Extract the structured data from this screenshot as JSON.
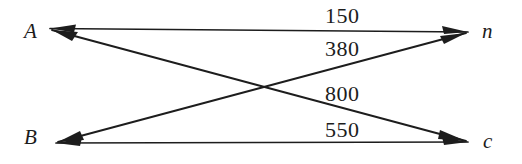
{
  "diagram": {
    "type": "bipartite-flow-network",
    "background_color": "#ffffff",
    "line_color": "#1d1d1d",
    "nodes": [
      {
        "id": "A",
        "label": "A",
        "side": "left",
        "position": "top"
      },
      {
        "id": "B",
        "label": "B",
        "side": "left",
        "position": "bottom"
      },
      {
        "id": "n",
        "label": "n",
        "side": "right",
        "position": "top"
      },
      {
        "id": "c",
        "label": "c",
        "side": "right",
        "position": "bottom"
      }
    ],
    "edges": [
      {
        "from": "A",
        "to": "n",
        "label": "150",
        "value": 150
      },
      {
        "from": "B",
        "to": "n",
        "label": "380",
        "value": 380
      },
      {
        "from": "A",
        "to": "c",
        "label": "800",
        "value": 800
      },
      {
        "from": "B",
        "to": "c",
        "label": "550",
        "value": 550
      }
    ]
  }
}
